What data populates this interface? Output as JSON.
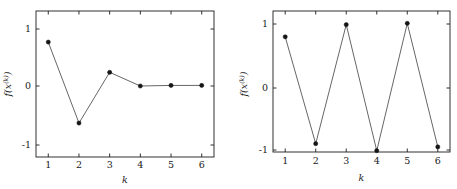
{
  "figure": {
    "background": "#ffffff",
    "line_color": "#4a4a4a",
    "marker_color": "#151515",
    "axis_color": "#1c1c1c"
  },
  "chart_data": [
    {
      "id": "left",
      "type": "line",
      "title": "",
      "xlabel": "k",
      "ylabel": "f(x^(k))",
      "ylabel_base": "f(x",
      "ylabel_sup": "(k)",
      "ylabel_tail": ")",
      "x": [
        1,
        2,
        3,
        4,
        5,
        6
      ],
      "values": [
        0.77,
        -0.65,
        0.24,
        0.0,
        0.01,
        0.01
      ],
      "xlim": [
        0.6,
        6.4
      ],
      "ylim": [
        -1.42,
        1.3
      ],
      "xticks": [
        1,
        2,
        3,
        4,
        5,
        6
      ],
      "xticklabels": [
        "1",
        "2",
        "3",
        "4",
        "5",
        "6"
      ],
      "yticks": [
        -1,
        0,
        1
      ],
      "yticklabels": [
        "-1",
        "0",
        "1"
      ],
      "grid": false,
      "legend": false,
      "markers": "filled-circle"
    },
    {
      "id": "right",
      "type": "line",
      "title": "",
      "xlabel": "k",
      "ylabel": "f(x^(k))",
      "ylabel_base": "f(x",
      "ylabel_sup": "(k)",
      "ylabel_tail": ")",
      "x": [
        1,
        2,
        3,
        4,
        5,
        6
      ],
      "values": [
        0.8,
        -0.87,
        0.99,
        -0.98,
        1.01,
        -0.92
      ],
      "xlim": [
        0.6,
        6.4
      ],
      "ylim": [
        -1.23,
        1.22
      ],
      "xticks": [
        1,
        2,
        3,
        4,
        5,
        6
      ],
      "xticklabels": [
        "1",
        "2",
        "3",
        "4",
        "5",
        "6"
      ],
      "yticks": [
        -1,
        0,
        1
      ],
      "yticklabels": [
        "-1",
        "0",
        "1"
      ],
      "grid": false,
      "legend": false,
      "markers": "filled-circle"
    }
  ]
}
